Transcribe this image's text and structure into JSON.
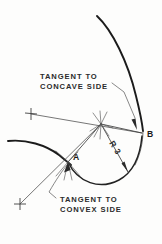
{
  "drawing": {
    "title": "Fillet radius tangent construction",
    "background_color": "#fdfdfc",
    "line_color": "#1b1b1b",
    "annotations": {
      "concave_note": {
        "line1": "TANGENT TO",
        "line2": "CONCAVE SIDE",
        "leader_target": "B"
      },
      "convex_note": {
        "line1": "TANGENT TO",
        "line2": "CONVEX SIDE",
        "leader_target": "A"
      }
    },
    "dimension": {
      "label": "R 3",
      "value": 3,
      "symbol": "R",
      "rotation_deg": 58
    },
    "points": [
      {
        "id": "A",
        "label": "A",
        "role": "tangent-point-convex"
      },
      {
        "id": "B",
        "label": "B",
        "role": "tangent-point-concave"
      }
    ],
    "construction_marks": [
      {
        "id": "upper-plus",
        "glyph": "+"
      },
      {
        "id": "lower-plus",
        "glyph": "+"
      },
      {
        "id": "arc-center",
        "glyph": "starburst"
      }
    ]
  }
}
